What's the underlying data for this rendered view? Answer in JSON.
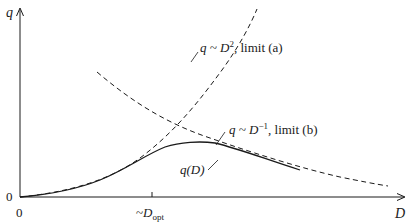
{
  "diagram": {
    "axes": {
      "y_label": "q",
      "x_label": "D",
      "y_origin_label": "0",
      "x_origin_label": "0",
      "x_tick_label_prefix": "~",
      "x_tick_label_var": "D",
      "x_tick_label_sub": "opt"
    },
    "curves": [
      {
        "name": "limit-a",
        "style": "dashed",
        "label_prefix": "q ~ ",
        "label_var": "D",
        "label_sup": "2",
        "label_suffix": ", limit (a)"
      },
      {
        "name": "limit-b",
        "style": "dashed",
        "label_prefix": "q ~ ",
        "label_var": "D",
        "label_sup": "−1",
        "label_suffix": ", limit (b)"
      },
      {
        "name": "q-of-D",
        "style": "solid",
        "label": "q(D)"
      }
    ],
    "colors": {
      "ink": "#1a1a1a",
      "background": "#ffffff"
    }
  }
}
